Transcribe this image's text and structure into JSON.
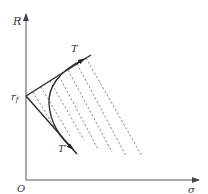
{
  "diagram": {
    "type": "Mohr failure envelope / slip-line construction",
    "axes": {
      "y_label": "R",
      "x_label": "σ",
      "origin_label": "O"
    },
    "intercept_label": "r",
    "intercept_subscript": "f",
    "upper_tangent_label": "T",
    "lower_tangent_label": "T′",
    "colors": {
      "line": "#2a2a2a",
      "dashed": "#6a6a6a",
      "axis": "#555555"
    },
    "geometry": {
      "origin": [
        26,
        180
      ],
      "y_axis_top": [
        26,
        13
      ],
      "x_axis_end": [
        199,
        180
      ],
      "rf_point": [
        26,
        96
      ],
      "upper_line_end": [
        90,
        55
      ],
      "lower_line_end": [
        77,
        153
      ],
      "dashed_line_count": 7
    }
  }
}
